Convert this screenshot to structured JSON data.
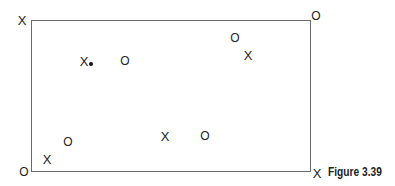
{
  "figure": {
    "caption": "Figure 3.39",
    "rectangle": {
      "left": 31,
      "top": 20,
      "right": 311,
      "bottom": 171,
      "stroke": "#6a6a6a"
    },
    "corner_marks": [
      {
        "id": "top-left",
        "symbol": "X",
        "x": 22,
        "y": 20
      },
      {
        "id": "top-right",
        "symbol": "O",
        "x": 316,
        "y": 16
      },
      {
        "id": "bottom-left",
        "symbol": "O",
        "x": 24,
        "y": 172
      },
      {
        "id": "bottom-right",
        "symbol": "X",
        "x": 317,
        "y": 173
      }
    ],
    "interior_marks": [
      {
        "symbol": "X",
        "x": 84,
        "y": 61,
        "has_dot": true,
        "dot_x": 91,
        "dot_y": 64
      },
      {
        "symbol": "O",
        "x": 125,
        "y": 61
      },
      {
        "symbol": "O",
        "x": 235,
        "y": 38
      },
      {
        "symbol": "X",
        "x": 248,
        "y": 55
      },
      {
        "symbol": "O",
        "x": 68,
        "y": 142
      },
      {
        "symbol": "X",
        "x": 47,
        "y": 159
      },
      {
        "symbol": "X",
        "x": 165,
        "y": 136
      },
      {
        "symbol": "O",
        "x": 205,
        "y": 136
      }
    ]
  }
}
